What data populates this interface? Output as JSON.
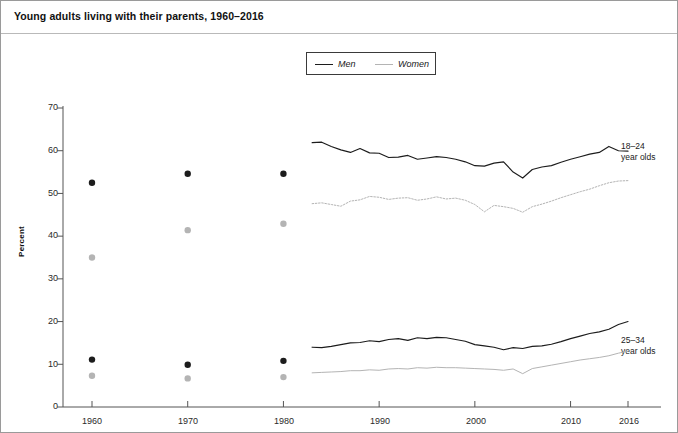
{
  "title": "Young adults living with their parents, 1960–2016",
  "legend": {
    "men_label": "Men",
    "women_label": "Women",
    "position": "top-center"
  },
  "axes": {
    "ylabel": "Percent",
    "yticks": [
      "70",
      "60",
      "50",
      "40",
      "30",
      "20",
      "10",
      "0"
    ],
    "xticks": [
      "1960",
      "1970",
      "1980",
      "1990",
      "2000",
      "2010",
      "2016"
    ]
  },
  "annotations": {
    "upper": "18–24\nyear olds",
    "lower": "25–34\nyear olds"
  },
  "colors": {
    "men": "#1c1c1c",
    "women": "#b4b4b4",
    "axis": "#555555",
    "frame": "#9a9a9a",
    "text": "#1a1a1a"
  },
  "chart_data": {
    "type": "line",
    "title": "Young adults living with their parents, 1960–2016",
    "xlabel": "",
    "ylabel": "Percent",
    "xlim": [
      1957,
      2018
    ],
    "ylim": [
      0,
      70
    ],
    "grid": false,
    "legend_entries": [
      "Men",
      "Women"
    ],
    "legend_position": "top-center",
    "series": [
      {
        "name": "Men, 18–24 year olds",
        "group": "18-24",
        "sex": "Men",
        "style": "solid",
        "color": "#1c1c1c",
        "marker": "circle",
        "decade_points": {
          "x": [
            1960,
            1970,
            1980
          ],
          "y": [
            52.5,
            54.6,
            54.6
          ]
        },
        "x": [
          1983,
          1984,
          1985,
          1986,
          1987,
          1988,
          1989,
          1990,
          1991,
          1992,
          1993,
          1994,
          1995,
          1996,
          1997,
          1998,
          1999,
          2000,
          2001,
          2002,
          2003,
          2004,
          2005,
          2006,
          2007,
          2008,
          2009,
          2010,
          2011,
          2012,
          2013,
          2014,
          2015,
          2016
        ],
        "y": [
          61.9,
          62.0,
          61.0,
          60.2,
          59.6,
          60.5,
          59.5,
          59.4,
          58.4,
          58.5,
          58.9,
          58.0,
          58.3,
          58.6,
          58.4,
          58.0,
          57.4,
          56.5,
          56.4,
          57.1,
          57.4,
          55.0,
          53.6,
          55.6,
          56.2,
          56.5,
          57.3,
          58.0,
          58.6,
          59.2,
          59.6,
          61.0,
          60.0,
          59.9
        ],
        "note": "Solid dark line, 18–24 year olds, upper pair"
      },
      {
        "name": "Women, 18–24 year olds",
        "group": "18-24",
        "sex": "Women",
        "style": "dotted",
        "color": "#b4b4b4",
        "marker": "circle",
        "decade_points": {
          "x": [
            1960,
            1970,
            1980
          ],
          "y": [
            35.0,
            41.4,
            42.9
          ]
        },
        "x": [
          1983,
          1984,
          1985,
          1986,
          1987,
          1988,
          1989,
          1990,
          1991,
          1992,
          1993,
          1994,
          1995,
          1996,
          1997,
          1998,
          1999,
          2000,
          2001,
          2002,
          2003,
          2004,
          2005,
          2006,
          2007,
          2008,
          2009,
          2010,
          2011,
          2012,
          2013,
          2014,
          2015,
          2016
        ],
        "y": [
          47.6,
          47.8,
          47.4,
          47.0,
          48.2,
          48.5,
          49.3,
          49.1,
          48.6,
          48.9,
          49.0,
          48.4,
          48.7,
          49.2,
          48.7,
          48.9,
          48.4,
          47.4,
          45.7,
          47.2,
          46.9,
          46.5,
          45.6,
          46.9,
          47.5,
          48.2,
          49.0,
          49.7,
          50.4,
          51.0,
          51.8,
          52.5,
          52.9,
          53.0
        ],
        "note": "Light dotted line, 18–24 year olds, upper pair"
      },
      {
        "name": "Men, 25–34 year olds",
        "group": "25-34",
        "sex": "Men",
        "style": "solid",
        "color": "#1c1c1c",
        "marker": "circle",
        "decade_points": {
          "x": [
            1960,
            1970,
            1980
          ],
          "y": [
            11.1,
            9.9,
            10.8
          ]
        },
        "x": [
          1983,
          1984,
          1985,
          1986,
          1987,
          1988,
          1989,
          1990,
          1991,
          1992,
          1993,
          1994,
          1995,
          1996,
          1997,
          1998,
          1999,
          2000,
          2001,
          2002,
          2003,
          2004,
          2005,
          2006,
          2007,
          2008,
          2009,
          2010,
          2011,
          2012,
          2013,
          2014,
          2015,
          2016
        ],
        "y": [
          14.0,
          13.9,
          14.2,
          14.6,
          15.0,
          15.1,
          15.5,
          15.3,
          15.8,
          16.0,
          15.6,
          16.2,
          16.0,
          16.3,
          16.2,
          15.8,
          15.4,
          14.6,
          14.3,
          14.0,
          13.4,
          13.9,
          13.7,
          14.2,
          14.3,
          14.7,
          15.3,
          16.0,
          16.6,
          17.2,
          17.6,
          18.2,
          19.3,
          20.0
        ],
        "note": "Solid dark line, 25–34 year olds, lower pair"
      },
      {
        "name": "Women, 25–34 year olds",
        "group": "25-34",
        "sex": "Women",
        "style": "solid-light",
        "color": "#b4b4b4",
        "marker": "circle",
        "decade_points": {
          "x": [
            1960,
            1970,
            1980
          ],
          "y": [
            7.3,
            6.7,
            7.0
          ]
        },
        "x": [
          1983,
          1984,
          1985,
          1986,
          1987,
          1988,
          1989,
          1990,
          1991,
          1992,
          1993,
          1994,
          1995,
          1996,
          1997,
          1998,
          1999,
          2000,
          2001,
          2002,
          2003,
          2004,
          2005,
          2006,
          2007,
          2008,
          2009,
          2010,
          2011,
          2012,
          2013,
          2014,
          2015,
          2016
        ],
        "y": [
          8.0,
          8.1,
          8.2,
          8.3,
          8.5,
          8.5,
          8.7,
          8.6,
          8.9,
          9.0,
          8.9,
          9.2,
          9.1,
          9.3,
          9.2,
          9.2,
          9.1,
          9.0,
          8.9,
          8.8,
          8.6,
          8.9,
          7.8,
          9.0,
          9.4,
          9.8,
          10.2,
          10.6,
          11.0,
          11.3,
          11.6,
          12.0,
          12.6,
          13.1
        ],
        "note": "Light solid line, 25–34 year olds, lower pair"
      }
    ],
    "annotations": [
      {
        "text": "18–24 year olds",
        "x": 2017,
        "y": 57
      },
      {
        "text": "25–34 year olds",
        "x": 2017,
        "y": 17
      }
    ]
  }
}
